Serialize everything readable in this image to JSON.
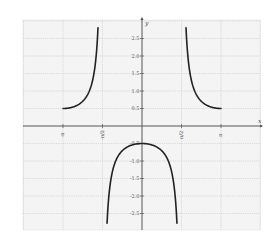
{
  "chart_data": {
    "type": "line",
    "title": "",
    "function": "y = -1/(2cos x)",
    "xlabel": "x",
    "ylabel": "y",
    "xlim": [
      -4.712,
      4.712
    ],
    "ylim": [
      -3.0,
      3.0
    ],
    "grid": true,
    "x_ticks": [
      {
        "value": -3.1416,
        "label": "-π"
      },
      {
        "value": -1.5708,
        "label": "-π/2"
      },
      {
        "value": 1.5708,
        "label": "π/2"
      },
      {
        "value": 3.1416,
        "label": "π"
      }
    ],
    "y_ticks": [
      {
        "value": 2.5,
        "label": "2.5"
      },
      {
        "value": 2.0,
        "label": "2.0"
      },
      {
        "value": 1.5,
        "label": "1.5"
      },
      {
        "value": 1.0,
        "label": "1.0"
      },
      {
        "value": 0.5,
        "label": "0.5"
      },
      {
        "value": -0.5,
        "label": "-0.5"
      },
      {
        "value": -1.0,
        "label": "-1.0"
      },
      {
        "value": -1.5,
        "label": "-1.5"
      },
      {
        "value": -2.0,
        "label": "-2.0"
      },
      {
        "value": -2.5,
        "label": "-2.5"
      }
    ],
    "series": [
      {
        "name": "left branch",
        "domain": [
          -3.1416,
          -1.75
        ],
        "points": [
          [
            -3.1416,
            0.5
          ],
          [
            -2.5,
            0.62
          ],
          [
            -2.0,
            1.2
          ],
          [
            -1.8,
            2.2
          ],
          [
            -1.76,
            2.7
          ]
        ]
      },
      {
        "name": "middle branch",
        "domain": [
          -1.39,
          1.39
        ],
        "points": [
          [
            -1.39,
            -2.8
          ],
          [
            -1.2,
            -1.38
          ],
          [
            -0.8,
            -0.72
          ],
          [
            0,
            -0.5
          ],
          [
            0.8,
            -0.72
          ],
          [
            1.2,
            -1.38
          ],
          [
            1.39,
            -2.8
          ]
        ]
      },
      {
        "name": "right branch",
        "domain": [
          1.75,
          3.1416
        ],
        "points": [
          [
            1.76,
            2.7
          ],
          [
            1.8,
            2.2
          ],
          [
            2.0,
            1.2
          ],
          [
            2.5,
            0.62
          ],
          [
            3.1416,
            0.5
          ]
        ]
      }
    ],
    "colors": {
      "curve": "#222222",
      "grid": "#c8c8c8",
      "axis": "#555555",
      "background": "#f4f4f4"
    }
  }
}
